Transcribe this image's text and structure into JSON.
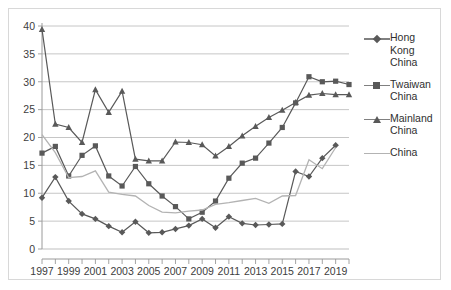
{
  "chart_data": {
    "type": "line",
    "title": "",
    "xlabel": "",
    "ylabel": "",
    "ylim": [
      0,
      40
    ],
    "ytick_step": 5,
    "grid": true,
    "legend_position": "right",
    "x": [
      1997,
      1998,
      1999,
      2000,
      2001,
      2002,
      2003,
      2004,
      2005,
      2006,
      2007,
      2008,
      2009,
      2010,
      2011,
      2012,
      2013,
      2014,
      2015,
      2016,
      2017,
      2018,
      2019,
      2020
    ],
    "xtick_labels": [
      "1997",
      "",
      "1999",
      "",
      "2001",
      "",
      "2003",
      "",
      "2005",
      "",
      "2007",
      "",
      "2009",
      "",
      "2011",
      "",
      "2013",
      "",
      "2015",
      "",
      "2017",
      "",
      "2019",
      ""
    ],
    "ytick_labels": [
      "0",
      "5",
      "10",
      "15",
      "20",
      "25",
      "30",
      "35",
      "40"
    ],
    "series": [
      {
        "name": "Hong Kong China",
        "marker": "diamond",
        "color": "#595959",
        "values": [
          9.2,
          12.9,
          8.6,
          6.3,
          5.4,
          4.1,
          3.0,
          4.9,
          2.9,
          3.0,
          3.6,
          4.2,
          5.4,
          3.8,
          5.8,
          4.6,
          4.3,
          4.4,
          4.5,
          13.9,
          13.0,
          16.3,
          18.6,
          null
        ]
      },
      {
        "name": "Twaiwan China",
        "marker": "square",
        "color": "#595959",
        "values": [
          17.2,
          18.4,
          13.1,
          16.8,
          18.5,
          13.1,
          11.3,
          14.8,
          11.7,
          9.5,
          7.6,
          5.4,
          6.6,
          8.6,
          12.7,
          15.4,
          16.3,
          19.0,
          21.8,
          26.2,
          30.9,
          30.0,
          30.1,
          29.5
        ]
      },
      {
        "name": "Mainland China",
        "marker": "triangle",
        "color": "#595959",
        "values": [
          39.4,
          22.4,
          21.8,
          19.1,
          28.6,
          24.5,
          28.3,
          16.1,
          15.8,
          15.8,
          19.2,
          19.1,
          18.7,
          16.7,
          18.4,
          20.3,
          22.0,
          23.6,
          24.9,
          26.3,
          27.6,
          27.9,
          27.7,
          27.7
        ]
      },
      {
        "name": "China",
        "marker": "none",
        "color": "#b3b3b3",
        "values": [
          20.5,
          17.3,
          12.8,
          13.0,
          14.0,
          10.2,
          9.8,
          9.5,
          7.8,
          6.6,
          6.5,
          6.8,
          7.0,
          8.0,
          8.3,
          8.7,
          9.1,
          8.2,
          9.5,
          9.6,
          16.0,
          14.4,
          18.2,
          null
        ]
      }
    ]
  },
  "legend": {
    "items": [
      {
        "label": "Hong Kong China",
        "marker": "diamond"
      },
      {
        "label": "Twaiwan China",
        "marker": "square"
      },
      {
        "label": "Mainland China",
        "marker": "triangle"
      },
      {
        "label": "China",
        "marker": "none"
      }
    ]
  }
}
